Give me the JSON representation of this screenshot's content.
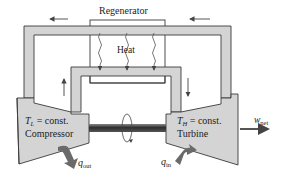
{
  "diagram": {
    "regenerator": {
      "label": "Regenerator"
    },
    "heat": {
      "label": "Heat"
    },
    "compressor": {
      "temp_symbol": "T",
      "temp_subscript": "L",
      "temp_text": " = const.",
      "name": "Compressor"
    },
    "turbine": {
      "temp_symbol": "T",
      "temp_subscript": "H",
      "temp_text": " = const.",
      "name": "Turbine"
    },
    "work_out": {
      "symbol": "w",
      "subscript": "net"
    },
    "heat_out": {
      "symbol": "q",
      "subscript": "out"
    },
    "heat_in": {
      "symbol": "q",
      "subscript": "in"
    },
    "colors": {
      "fill": "#d4d4d4",
      "stroke": "#3a3a3a",
      "arrow": "#5a5a5a",
      "shaft": "#4a4a4a"
    }
  }
}
